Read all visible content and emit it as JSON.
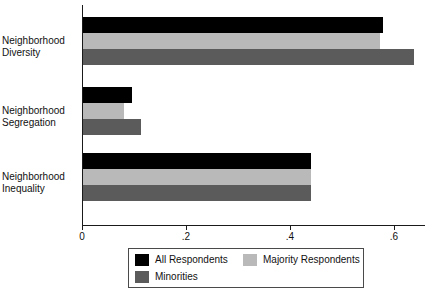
{
  "chart_data": {
    "type": "bar",
    "orientation": "horizontal",
    "title": "",
    "subtitle": "",
    "xlabel": "",
    "ylabel": "",
    "categories": [
      "Neighborhood Diversity",
      "Neighborhood Segregation",
      "Neighborhood Inequality"
    ],
    "series": [
      {
        "name": "All Respondents",
        "color": "#000000",
        "values": [
          0.577,
          0.094,
          0.438
        ]
      },
      {
        "name": "Majority Respondents",
        "color": "#b9b9b9",
        "values": [
          0.571,
          0.079,
          0.438
        ]
      },
      {
        "name": "Minorities",
        "color": "#5b5b5b",
        "values": [
          0.636,
          0.112,
          0.438
        ]
      }
    ],
    "xlim": [
      0,
      0.66
    ],
    "xticks": [
      0,
      0.2,
      0.4,
      0.6
    ],
    "xtick_labels": [
      "0",
      ".2",
      ".4",
      ".6"
    ],
    "grid": false,
    "legend_position": "bottom"
  },
  "categories": {
    "c0_line1": "Neighborhood",
    "c0_line2": "Diversity",
    "c1_line1": "Neighborhood",
    "c1_line2": "Segregation",
    "c2_line1": "Neighborhood",
    "c2_line2": "Inequality"
  },
  "axis": {
    "tick0": "0",
    "tick1": ".2",
    "tick2": ".4",
    "tick3": ".6"
  },
  "legend": {
    "items": [
      {
        "label": "All Respondents"
      },
      {
        "label": "Majority Respondents"
      },
      {
        "label": "Minorities"
      }
    ]
  }
}
